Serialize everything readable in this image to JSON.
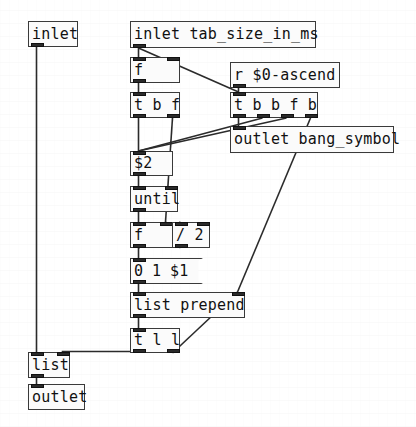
{
  "patch": {
    "title": "pd-patch-tab-size-ascend",
    "canvas": {
      "width": 416,
      "height": 427,
      "background": "#ffffff"
    },
    "style": {
      "box_border": "#3a3a3a",
      "box_fill": "#fbfbfb",
      "text": "#111111",
      "wire": "#2b2b2b",
      "port": "#2a2a2a"
    }
  },
  "objects": [
    {
      "id": "inlet_left",
      "kind": "object",
      "text": "inlet",
      "x": 28,
      "y": 21,
      "w": 50,
      "h": 26,
      "inlets": 0,
      "outlets": 1
    },
    {
      "id": "inlet_tab_size",
      "kind": "object",
      "text": "inlet tab_size_in_ms",
      "x": 130,
      "y": 21,
      "w": 186,
      "h": 27,
      "inlets": 0,
      "outlets": 1
    },
    {
      "id": "f_top",
      "kind": "object",
      "text": "f",
      "x": 130,
      "y": 57,
      "w": 50,
      "h": 26,
      "inlets": 2,
      "outlets": 1
    },
    {
      "id": "r_ascend",
      "kind": "object",
      "text": "r $0-ascend",
      "x": 230,
      "y": 62,
      "w": 110,
      "h": 26,
      "inlets": 0,
      "outlets": 1
    },
    {
      "id": "t_b_f",
      "kind": "object",
      "text": "t b f",
      "x": 130,
      "y": 92,
      "w": 50,
      "h": 26,
      "inlets": 1,
      "outlets": 2
    },
    {
      "id": "t_b_b_f_b",
      "kind": "object",
      "text": "t b b f b",
      "x": 230,
      "y": 92,
      "w": 88,
      "h": 26,
      "inlets": 1,
      "outlets": 4
    },
    {
      "id": "outlet_bang_symbol",
      "kind": "object",
      "text": "outlet bang_symbol",
      "x": 230,
      "y": 126,
      "w": 164,
      "h": 27,
      "inlets": 1,
      "outlets": 0
    },
    {
      "id": "dollar2",
      "kind": "object",
      "text": "$2",
      "x": 130,
      "y": 151,
      "w": 43,
      "h": 25,
      "inlets": 1,
      "outlets": 1
    },
    {
      "id": "until",
      "kind": "object",
      "text": "until",
      "x": 130,
      "y": 186,
      "w": 48,
      "h": 26,
      "inlets": 2,
      "outlets": 1
    },
    {
      "id": "f_mid",
      "kind": "object",
      "text": "f",
      "x": 130,
      "y": 222,
      "w": 43,
      "h": 26,
      "inlets": 2,
      "outlets": 1
    },
    {
      "id": "div2",
      "kind": "object",
      "text": "/ 2",
      "x": 172,
      "y": 222,
      "w": 38,
      "h": 26,
      "inlets": 2,
      "outlets": 1
    },
    {
      "id": "msg_0_1_d1",
      "kind": "message",
      "text": "0 1 $1",
      "x": 130,
      "y": 258,
      "w": 73,
      "h": 26,
      "inlets": 1,
      "outlets": 1
    },
    {
      "id": "list_prepend",
      "kind": "object",
      "text": "list prepend",
      "x": 130,
      "y": 292,
      "w": 115,
      "h": 26,
      "inlets": 2,
      "outlets": 1
    },
    {
      "id": "t_l_l",
      "kind": "object",
      "text": "t l l",
      "x": 130,
      "y": 328,
      "w": 50,
      "h": 25,
      "inlets": 1,
      "outlets": 2
    },
    {
      "id": "list_obj",
      "kind": "object",
      "text": "list",
      "x": 28,
      "y": 352,
      "w": 42,
      "h": 26,
      "inlets": 2,
      "outlets": 1
    },
    {
      "id": "outlet_bottom",
      "kind": "object",
      "text": "outlet",
      "x": 28,
      "y": 384,
      "w": 57,
      "h": 26,
      "inlets": 1,
      "outlets": 0
    }
  ],
  "connections": [
    {
      "id": "c1",
      "from": "inlet_left",
      "from_outlet": 0,
      "to": "list_obj",
      "to_inlet": 0,
      "path": "orthogonal"
    },
    {
      "id": "c2",
      "from": "inlet_tab_size",
      "from_outlet": 0,
      "to": "f_top",
      "to_inlet": 0,
      "path": "direct"
    },
    {
      "id": "c3",
      "from": "inlet_tab_size",
      "from_outlet": 0,
      "to": "t_b_b_f_b",
      "to_inlet": 0,
      "path": "direct"
    },
    {
      "id": "c4",
      "from": "f_top",
      "from_outlet": 0,
      "to": "t_b_f",
      "to_inlet": 0,
      "path": "direct"
    },
    {
      "id": "c5",
      "from": "r_ascend",
      "from_outlet": 0,
      "to": "t_b_b_f_b",
      "to_inlet": 0,
      "path": "direct"
    },
    {
      "id": "c6",
      "from": "t_b_b_f_b",
      "from_outlet": 0,
      "to": "outlet_bang_symbol",
      "to_inlet": 0,
      "path": "direct"
    },
    {
      "id": "c7",
      "from": "t_b_b_f_b",
      "from_outlet": 1,
      "to": "dollar2",
      "to_inlet": 0,
      "path": "direct"
    },
    {
      "id": "c8",
      "from": "t_b_b_f_b",
      "from_outlet": 2,
      "to": "dollar2",
      "to_inlet": 0,
      "path": "direct"
    },
    {
      "id": "c9",
      "from": "t_b_b_f_b",
      "from_outlet": 3,
      "to": "list_prepend",
      "to_inlet": 1,
      "path": "direct"
    },
    {
      "id": "c10",
      "from": "t_b_f",
      "from_outlet": 0,
      "to": "dollar2",
      "to_inlet": 0,
      "path": "direct"
    },
    {
      "id": "c11",
      "from": "t_b_f",
      "from_outlet": 1,
      "to": "f_mid",
      "to_inlet": 1,
      "path": "direct"
    },
    {
      "id": "c12",
      "from": "dollar2",
      "from_outlet": 0,
      "to": "until",
      "to_inlet": 0,
      "path": "direct"
    },
    {
      "id": "c13",
      "from": "until",
      "from_outlet": 0,
      "to": "f_mid",
      "to_inlet": 0,
      "path": "direct"
    },
    {
      "id": "c14",
      "from": "f_mid",
      "from_outlet": 0,
      "to": "div2",
      "to_inlet": 0,
      "path": "direct"
    },
    {
      "id": "c15",
      "from": "div2",
      "from_outlet": 0,
      "to": "f_mid",
      "to_inlet": 1,
      "path": "direct"
    },
    {
      "id": "c16",
      "from": "f_mid",
      "from_outlet": 0,
      "to": "msg_0_1_d1",
      "to_inlet": 0,
      "path": "direct"
    },
    {
      "id": "c17",
      "from": "msg_0_1_d1",
      "from_outlet": 0,
      "to": "list_prepend",
      "to_inlet": 0,
      "path": "direct"
    },
    {
      "id": "c18",
      "from": "list_prepend",
      "from_outlet": 0,
      "to": "t_l_l",
      "to_inlet": 0,
      "path": "direct"
    },
    {
      "id": "c19",
      "from": "t_l_l",
      "from_outlet": 0,
      "to": "list_obj",
      "to_inlet": 1,
      "path": "orthogonal"
    },
    {
      "id": "c20",
      "from": "t_l_l",
      "from_outlet": 1,
      "to": "list_prepend",
      "to_inlet": 1,
      "path": "direct"
    },
    {
      "id": "c21",
      "from": "list_obj",
      "from_outlet": 0,
      "to": "outlet_bottom",
      "to_inlet": 0,
      "path": "direct"
    }
  ]
}
